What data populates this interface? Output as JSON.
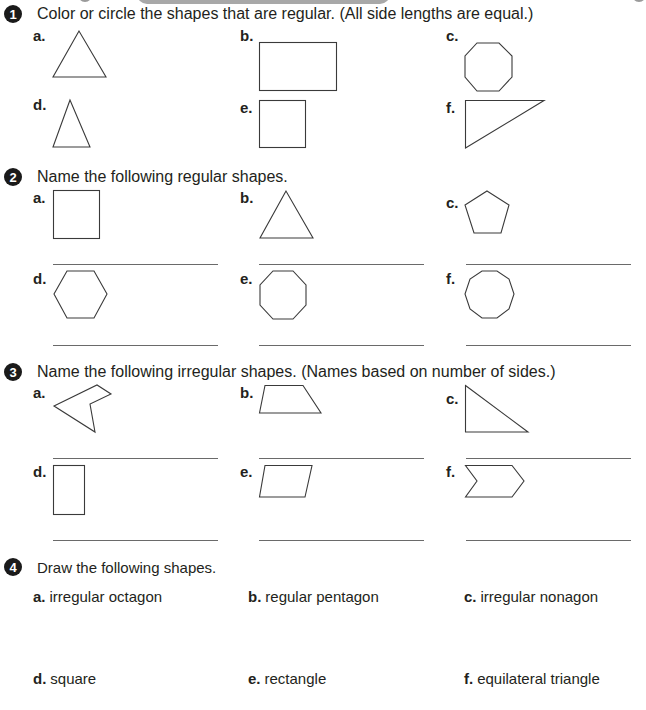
{
  "questions": [
    {
      "number": "1",
      "instruction": "Color or circle the shapes that are regular.  (All side lengths are equal.)",
      "items": [
        {
          "label": "a.",
          "shape": "equilateral-triangle"
        },
        {
          "label": "b.",
          "shape": "rectangle"
        },
        {
          "label": "c.",
          "shape": "regular-octagon"
        },
        {
          "label": "d.",
          "shape": "isosceles-triangle"
        },
        {
          "label": "e.",
          "shape": "square"
        },
        {
          "label": "f.",
          "shape": "right-triangle"
        }
      ]
    },
    {
      "number": "2",
      "instruction": "Name the following regular shapes.",
      "items": [
        {
          "label": "a.",
          "shape": "square"
        },
        {
          "label": "b.",
          "shape": "equilateral-triangle"
        },
        {
          "label": "c.",
          "shape": "regular-pentagon"
        },
        {
          "label": "d.",
          "shape": "regular-hexagon"
        },
        {
          "label": "e.",
          "shape": "regular-octagon"
        },
        {
          "label": "f.",
          "shape": "regular-decagon"
        }
      ]
    },
    {
      "number": "3",
      "instruction": "Name the following irregular shapes.  (Names based on number of sides.)",
      "items": [
        {
          "label": "a.",
          "shape": "irregular-pentagon-concave"
        },
        {
          "label": "b.",
          "shape": "trapezoid"
        },
        {
          "label": "c.",
          "shape": "right-triangle"
        },
        {
          "label": "d.",
          "shape": "rectangle"
        },
        {
          "label": "e.",
          "shape": "parallelogram"
        },
        {
          "label": "f.",
          "shape": "irregular-hexagon-chevron"
        }
      ]
    },
    {
      "number": "4",
      "instruction": "Draw the following shapes.",
      "items": [
        {
          "label": "a.",
          "text": "irregular octagon"
        },
        {
          "label": "b.",
          "text": "regular pentagon"
        },
        {
          "label": "c.",
          "text": "irregular nonagon"
        },
        {
          "label": "d.",
          "text": "square"
        },
        {
          "label": "e.",
          "text": "rectangle"
        },
        {
          "label": "f.",
          "text": "equilateral triangle"
        }
      ]
    }
  ],
  "colors": {
    "text": "#231f20",
    "stroke": "#3a3a3a",
    "bullet_bg": "#1a1a1a",
    "header_bar": "#a8a8a8"
  }
}
